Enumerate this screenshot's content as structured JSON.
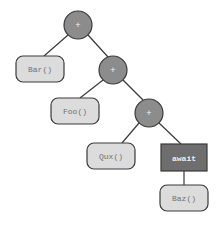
{
  "diagram": {
    "type": "expression-tree",
    "colors": {
      "background": "#ffffff",
      "operator_fill": "#8c8c8c",
      "operator_stroke": "#3a3a3a",
      "leaf_fill": "#dcdcdc",
      "leaf_stroke": "#3a3a3a",
      "leaf_text": "#707070",
      "await_fill": "#6e6e6e",
      "await_text": "#f0f0f0",
      "edge": "#3a3a3a"
    },
    "operators": [
      {
        "id": "op1",
        "label": "+"
      },
      {
        "id": "op2",
        "label": "+"
      },
      {
        "id": "op3",
        "label": "+"
      }
    ],
    "leaves": [
      {
        "id": "bar",
        "label": "Bar()"
      },
      {
        "id": "foo",
        "label": "Foo()"
      },
      {
        "id": "qux",
        "label": "Qux()"
      },
      {
        "id": "baz",
        "label": "Baz()"
      }
    ],
    "await_node": {
      "id": "await",
      "label": "await"
    },
    "edges": [
      [
        "op1",
        "bar"
      ],
      [
        "op1",
        "op2"
      ],
      [
        "op2",
        "foo"
      ],
      [
        "op2",
        "op3"
      ],
      [
        "op3",
        "qux"
      ],
      [
        "op3",
        "await"
      ],
      [
        "await",
        "baz"
      ]
    ]
  }
}
